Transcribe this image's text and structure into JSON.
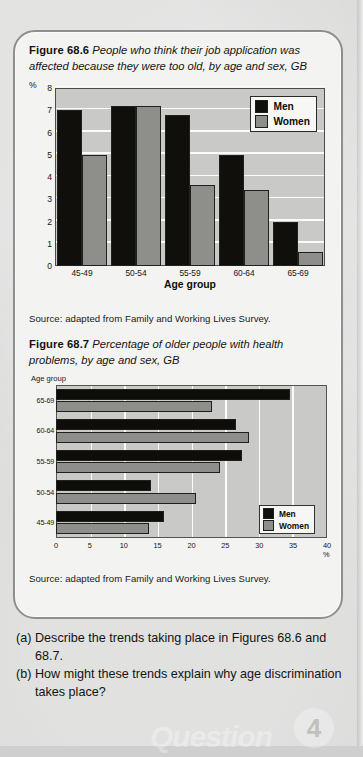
{
  "page": {
    "background_color": "#d4d4d3",
    "panel_color": "#f3f3f1",
    "border_color": "#8e8e8e"
  },
  "figure_686": {
    "number": "Figure 68.6",
    "caption": "People who think their job application was affected because they were too old, by age and sex, GB",
    "source": "Source: adapted from Family and Working Lives Survey."
  },
  "figure_687": {
    "number": "Figure 68.7",
    "caption": "Percentage of older people with health problems, by age and sex, GB",
    "source": "Source: adapted from Family and Working Lives Survey."
  },
  "questions": [
    {
      "tag": "(a)",
      "text": "Describe the trends taking place in Figures 68.6 and 68.7."
    },
    {
      "tag": "(b)",
      "text": "How might these trends explain why age discrimination takes place?"
    }
  ],
  "watermark": {
    "word": "Question",
    "badge": "4"
  },
  "colors": {
    "men": "#100f0c",
    "women": "#8e8e8b",
    "plot_bg": "#c9c9c7",
    "gridline": "#fbfbfa"
  },
  "chart_data": [
    {
      "id": "figure-68-6",
      "type": "bar",
      "orientation": "vertical",
      "title": "People who think their job application was affected because they were too old, by age and sex, GB",
      "xlabel": "Age group",
      "ylabel": "%",
      "ylim": [
        0,
        8
      ],
      "yticks": [
        0,
        1,
        2,
        3,
        4,
        5,
        6,
        7,
        8
      ],
      "grid": true,
      "legend": [
        "Men",
        "Women"
      ],
      "legend_position": "top-right-inside",
      "categories": [
        "45-49",
        "50-54",
        "55-59",
        "60-64",
        "65-69"
      ],
      "series": [
        {
          "name": "Men",
          "color": "#100f0c",
          "values": [
            7.0,
            7.2,
            6.8,
            5.0,
            2.0
          ]
        },
        {
          "name": "Women",
          "color": "#8e8e8b",
          "values": [
            5.0,
            7.2,
            3.65,
            3.4,
            0.65
          ]
        }
      ]
    },
    {
      "id": "figure-68-7",
      "type": "bar",
      "orientation": "horizontal",
      "title": "Percentage of older people with health problems, by age and sex, GB",
      "xlabel": "%",
      "ylabel": "Age group",
      "xlim": [
        0,
        40
      ],
      "xticks": [
        0,
        5,
        10,
        15,
        20,
        25,
        30,
        35,
        40
      ],
      "xtick_labels": [
        "0",
        "5",
        "10",
        "15",
        "20",
        "25",
        "30",
        "35",
        "40 %"
      ],
      "grid": true,
      "legend": [
        "Men",
        "Women"
      ],
      "legend_position": "bottom-right-inside",
      "categories": [
        "65-69",
        "60-64",
        "55-59",
        "50-54",
        "45-49"
      ],
      "series": [
        {
          "name": "Men",
          "color": "#0e0d0a",
          "values": [
            34.5,
            26.5,
            27.5,
            14.0,
            16.0
          ]
        },
        {
          "name": "Women",
          "color": "#8e8e8b",
          "values": [
            23.0,
            28.5,
            24.2,
            20.7,
            13.7
          ]
        }
      ]
    }
  ]
}
